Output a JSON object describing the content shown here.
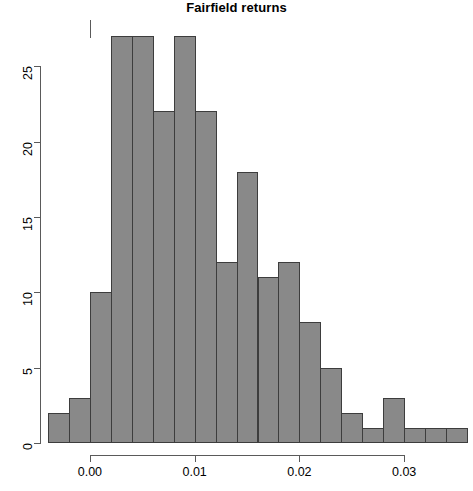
{
  "chart_data": {
    "type": "bar",
    "title": "Fairfield returns",
    "xlabel": "",
    "ylabel": "",
    "bin_width": 0.002,
    "bin_starts": [
      -0.004,
      -0.002,
      0.0,
      0.002,
      0.004,
      0.006,
      0.008,
      0.01,
      0.012,
      0.014,
      0.016,
      0.018,
      0.02,
      0.022,
      0.024,
      0.026,
      0.028,
      0.03,
      0.032,
      0.034
    ],
    "categories": [
      "-0.004",
      "-0.002",
      "0.000",
      "0.002",
      "0.004",
      "0.006",
      "0.008",
      "0.010",
      "0.012",
      "0.014",
      "0.016",
      "0.018",
      "0.020",
      "0.022",
      "0.024",
      "0.026",
      "0.028",
      "0.030",
      "0.032",
      "0.034"
    ],
    "values": [
      2,
      3,
      10,
      27,
      27,
      22,
      27,
      22,
      12,
      18,
      11,
      12,
      8,
      5,
      2,
      1,
      3,
      1,
      1,
      1
    ],
    "xlim": [
      -0.0045,
      0.0355
    ],
    "ylim": [
      0,
      27
    ],
    "x_ticks": [
      0.0,
      0.01,
      0.02,
      0.03
    ],
    "x_tick_labels": [
      "0.00",
      "0.01",
      "0.02",
      "0.03"
    ],
    "y_ticks": [
      0,
      5,
      10,
      15,
      20,
      25
    ],
    "y_tick_labels": [
      "0",
      "5",
      "10",
      "15",
      "20",
      "25"
    ],
    "grid": false,
    "legend": null,
    "bar_color": "#898989",
    "bar_border_color": "#3d3d3d",
    "axis_color": "#5a5a5a"
  }
}
